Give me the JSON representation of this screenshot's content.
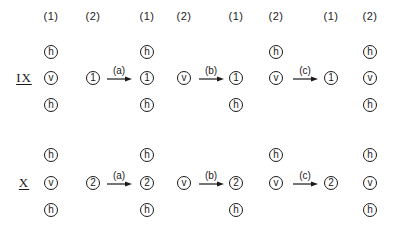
{
  "headers": {
    "c1": "(1)",
    "c2": "(2)",
    "c3": "(1)",
    "c4": "(2)",
    "c5": "(1)",
    "c6": "(2)",
    "c7": "(1)",
    "c8": "(2)"
  },
  "rows": [
    {
      "label": "IX",
      "start_col1": [
        "h",
        "v",
        "h"
      ],
      "start_col2": "1",
      "arrow_a": "(a)",
      "after_a_col1": [
        "h",
        "1",
        "h"
      ],
      "after_a_col2": "v",
      "arrow_b": "(b)",
      "after_b_col1": [
        "1",
        "h"
      ],
      "after_b_col2": [
        "h",
        "v"
      ],
      "arrow_c": "(c)",
      "after_c_col1": "1",
      "after_c_col2": [
        "h",
        "v",
        "h"
      ]
    },
    {
      "label": "X",
      "start_col1": [
        "h",
        "v",
        "h"
      ],
      "start_col2": "2",
      "arrow_a": "(a)",
      "after_a_col1": [
        "h",
        "2",
        "h"
      ],
      "after_a_col2": "v",
      "arrow_b": "(b)",
      "after_b_col1": [
        "2",
        "h"
      ],
      "after_b_col2": [
        "h",
        "v"
      ],
      "arrow_c": "(c)",
      "after_c_col1": "2",
      "after_c_col2": [
        "h",
        "v",
        "h"
      ]
    }
  ]
}
